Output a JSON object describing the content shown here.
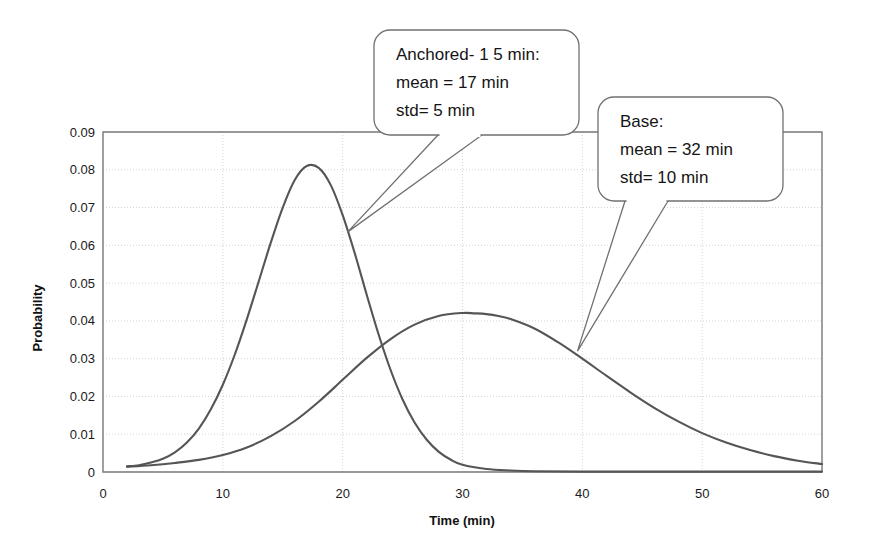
{
  "chart_data": {
    "type": "line",
    "title": "",
    "xlabel": "Time (min)",
    "ylabel": "Probability",
    "xlim": [
      0,
      60
    ],
    "ylim": [
      0,
      0.09
    ],
    "grid": true,
    "legend_position": "none",
    "xticks": [
      "0",
      "10",
      "20",
      "30",
      "40",
      "50",
      "60"
    ],
    "xtick_values": [
      0,
      10,
      20,
      30,
      40,
      50,
      60
    ],
    "yticks": [
      "0",
      "0.01",
      "0.02",
      "0.03",
      "0.04",
      "0.05",
      "0.06",
      "0.07",
      "0.08",
      "0.09"
    ],
    "ytick_values": [
      0,
      0.01,
      0.02,
      0.03,
      0.04,
      0.05,
      0.06,
      0.07,
      0.08,
      0.09
    ],
    "series": [
      {
        "name": "Anchored-15 min",
        "mean": 17,
        "std": 5,
        "peak_x": 17,
        "peak_y": 0.081,
        "color": "#555555",
        "x": [
          2,
          3,
          4,
          5,
          6,
          7,
          8,
          9,
          10,
          11,
          12,
          13,
          14,
          15,
          16,
          17,
          18,
          19,
          20,
          21,
          22,
          23,
          24,
          25,
          26,
          27,
          28,
          29,
          30,
          32,
          34,
          36,
          40,
          45,
          50,
          55,
          60
        ],
        "values": [
          0.0015,
          0.0018,
          0.0025,
          0.0035,
          0.0052,
          0.0078,
          0.0115,
          0.0166,
          0.0231,
          0.0311,
          0.0404,
          0.0505,
          0.0607,
          0.07,
          0.0773,
          0.081,
          0.0805,
          0.076,
          0.068,
          0.058,
          0.047,
          0.0364,
          0.027,
          0.0192,
          0.0131,
          0.0086,
          0.0054,
          0.0033,
          0.0019,
          0.0008,
          0.0004,
          0.0002,
          0.0001,
          0.0001,
          0.0001,
          0.0001,
          0.0001
        ]
      },
      {
        "name": "Base",
        "mean": 32,
        "std": 10,
        "peak_x": 31.5,
        "peak_y": 0.042,
        "color": "#555555",
        "x": [
          2,
          4,
          6,
          8,
          10,
          12,
          14,
          16,
          18,
          20,
          22,
          24,
          26,
          28,
          30,
          31,
          32,
          33,
          34,
          36,
          38,
          40,
          42,
          44,
          46,
          48,
          50,
          52,
          54,
          56,
          58,
          60
        ],
        "values": [
          0.0014,
          0.0018,
          0.0024,
          0.0032,
          0.0045,
          0.0065,
          0.0095,
          0.0135,
          0.0186,
          0.0244,
          0.0302,
          0.0352,
          0.039,
          0.0413,
          0.0421,
          0.042,
          0.0418,
          0.0413,
          0.0405,
          0.038,
          0.0343,
          0.03,
          0.0255,
          0.0211,
          0.017,
          0.0134,
          0.0103,
          0.0078,
          0.0058,
          0.0042,
          0.003,
          0.0021
        ]
      }
    ],
    "annotations": [
      {
        "id": "anchored",
        "lines": [
          "Anchored- 1 5 min:",
          "mean = 17 min",
          "std= 5 min"
        ],
        "points_to_x": 20.4,
        "points_to_y": 0.0635
      },
      {
        "id": "base",
        "lines": [
          "Base:",
          "mean = 32 min",
          "std= 10 min"
        ],
        "points_to_x": 39.6,
        "points_to_y": 0.032
      }
    ]
  },
  "colors": {
    "curve": "#555555",
    "frame": "#777777",
    "grid": "#c9c9c9",
    "callout_border": "#707070",
    "text": "#151515",
    "background": "#ffffff"
  }
}
